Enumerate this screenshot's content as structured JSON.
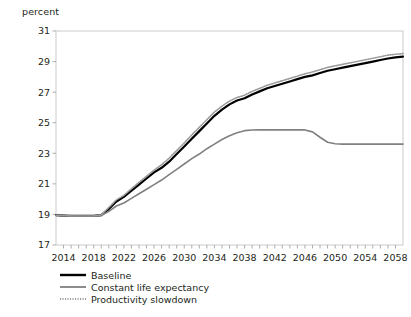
{
  "chart_data": {
    "type": "line",
    "title": "",
    "subtitle": "",
    "xlabel": "",
    "ylabel": "percent",
    "ylim": [
      17,
      31
    ],
    "xlim": [
      2013,
      2059
    ],
    "yticks": [
      17,
      19,
      21,
      23,
      25,
      27,
      29,
      31
    ],
    "xticks": [
      2014,
      2018,
      2022,
      2026,
      2030,
      2034,
      2038,
      2042,
      2046,
      2050,
      2054,
      2058
    ],
    "xtick_step_minor": 1,
    "grid": false,
    "legend_position": "bottom-left",
    "x": [
      2013,
      2014,
      2015,
      2016,
      2017,
      2018,
      2019,
      2020,
      2021,
      2022,
      2023,
      2024,
      2025,
      2026,
      2027,
      2028,
      2029,
      2030,
      2031,
      2032,
      2033,
      2034,
      2035,
      2036,
      2037,
      2038,
      2039,
      2040,
      2041,
      2042,
      2043,
      2044,
      2045,
      2046,
      2047,
      2048,
      2049,
      2050,
      2051,
      2052,
      2053,
      2054,
      2055,
      2056,
      2057,
      2058,
      2059
    ],
    "series": [
      {
        "name": "Baseline",
        "color": "#000000",
        "style": "solid",
        "width": 2.2,
        "values": [
          18.95,
          18.92,
          18.9,
          18.9,
          18.9,
          18.9,
          18.95,
          19.35,
          19.85,
          20.15,
          20.55,
          20.95,
          21.35,
          21.75,
          22.05,
          22.45,
          22.95,
          23.45,
          23.95,
          24.45,
          24.95,
          25.45,
          25.85,
          26.2,
          26.45,
          26.6,
          26.85,
          27.05,
          27.25,
          27.4,
          27.55,
          27.7,
          27.85,
          28.0,
          28.1,
          28.25,
          28.4,
          28.5,
          28.6,
          28.7,
          28.8,
          28.9,
          29.0,
          29.1,
          29.2,
          29.28,
          29.32
        ]
      },
      {
        "name": "Constant life expectancy",
        "color": "#808080",
        "style": "solid",
        "width": 1.6,
        "values": [
          18.95,
          18.92,
          18.9,
          18.9,
          18.9,
          18.9,
          18.92,
          19.2,
          19.55,
          19.75,
          20.05,
          20.35,
          20.65,
          20.95,
          21.25,
          21.6,
          21.95,
          22.3,
          22.65,
          22.95,
          23.3,
          23.6,
          23.9,
          24.15,
          24.35,
          24.48,
          24.52,
          24.53,
          24.53,
          24.53,
          24.53,
          24.53,
          24.53,
          24.53,
          24.4,
          24.05,
          23.72,
          23.62,
          23.6,
          23.6,
          23.6,
          23.6,
          23.6,
          23.6,
          23.6,
          23.6,
          23.6
        ]
      },
      {
        "name": "Productivity slowdown",
        "color": "#9a9a9a",
        "style": "dotted",
        "width": 1.6,
        "values": [
          18.95,
          18.92,
          18.9,
          18.9,
          18.9,
          18.9,
          18.97,
          19.45,
          19.95,
          20.25,
          20.68,
          21.1,
          21.5,
          21.9,
          22.25,
          22.68,
          23.18,
          23.68,
          24.2,
          24.7,
          25.2,
          25.7,
          26.08,
          26.42,
          26.65,
          26.8,
          27.05,
          27.25,
          27.45,
          27.6,
          27.75,
          27.9,
          28.05,
          28.2,
          28.32,
          28.47,
          28.62,
          28.72,
          28.82,
          28.92,
          29.02,
          29.12,
          29.22,
          29.32,
          29.42,
          29.48,
          29.52
        ]
      }
    ],
    "legend": [
      {
        "label": "Baseline",
        "color": "#000000",
        "style": "solid"
      },
      {
        "label": "Constant life expectancy",
        "color": "#808080",
        "style": "solid"
      },
      {
        "label": "Productivity slowdown",
        "color": "#9a9a9a",
        "style": "dotted"
      }
    ]
  },
  "figure": {
    "unit_label": "percent"
  }
}
